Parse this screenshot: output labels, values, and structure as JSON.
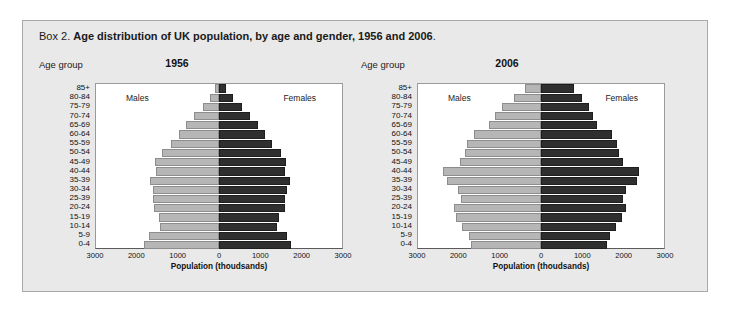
{
  "figure": {
    "box_label": "Box 2.",
    "title": "Age distribution of UK population, by age and gender, 1956 and 2006",
    "title_end": ".",
    "age_group_caption": "Age group",
    "series_labels": {
      "male": "Males",
      "female": "Females"
    },
    "colors": {
      "male_bar": "#b6b6b6",
      "female_bar": "#2f2f2f",
      "figure_background": "#e9e9e9",
      "plot_background": "#ffffff",
      "border": "#a8a8a8"
    }
  },
  "chart_data": [
    {
      "type": "bar",
      "subtype": "population-pyramid",
      "title": "1956",
      "xlabel": "Population (thoudsands)",
      "ylabel": "Age group",
      "xlim": [
        -3000,
        3000
      ],
      "xticks": [
        "3000",
        "2000",
        "1000",
        "0",
        "1000",
        "2000",
        "3000"
      ],
      "xtick_values": [
        -3000,
        -2000,
        -1000,
        0,
        1000,
        2000,
        3000
      ],
      "grid": false,
      "legend": "inside-panel",
      "categories": [
        "85+",
        "80-84",
        "75-79",
        "70-74",
        "65-69",
        "60-64",
        "55-59",
        "50-54",
        "45-49",
        "40-44",
        "35-39",
        "30-34",
        "25-39",
        "20-24",
        "15-19",
        "10-14",
        "5-9",
        "0-4"
      ],
      "series": [
        {
          "name": "Males",
          "side": "left",
          "values": [
            110,
            230,
            400,
            600,
            800,
            980,
            1180,
            1400,
            1560,
            1540,
            1680,
            1620,
            1600,
            1580,
            1460,
            1430,
            1700,
            1830
          ]
        },
        {
          "name": "Females",
          "side": "right",
          "values": [
            180,
            350,
            560,
            760,
            950,
            1120,
            1300,
            1500,
            1640,
            1600,
            1730,
            1650,
            1620,
            1600,
            1460,
            1420,
            1660,
            1760
          ]
        }
      ]
    },
    {
      "type": "bar",
      "subtype": "population-pyramid",
      "title": "2006",
      "xlabel": "Population (thoudsands)",
      "ylabel": "Age group",
      "xlim": [
        -3000,
        3000
      ],
      "xticks": [
        "3000",
        "2000",
        "1000",
        "0",
        "1000",
        "2000",
        "3000"
      ],
      "xtick_values": [
        -3000,
        -2000,
        -1000,
        0,
        1000,
        2000,
        3000
      ],
      "grid": false,
      "legend": "inside-panel",
      "categories": [
        "85+",
        "80-84",
        "75-79",
        "70-74",
        "65-69",
        "60-64",
        "55-59",
        "50-54",
        "45-49",
        "40-44",
        "35-39",
        "30-34",
        "25-39",
        "20-24",
        "15-19",
        "10-14",
        "5-9",
        "0-4"
      ],
      "series": [
        {
          "name": "Males",
          "side": "left",
          "values": [
            380,
            650,
            950,
            1130,
            1270,
            1640,
            1800,
            1860,
            1980,
            2380,
            2300,
            2020,
            1960,
            2130,
            2080,
            1930,
            1760,
            1700
          ]
        },
        {
          "name": "Females",
          "side": "right",
          "values": [
            800,
            1000,
            1180,
            1280,
            1360,
            1720,
            1850,
            1900,
            2010,
            2400,
            2330,
            2070,
            2000,
            2070,
            1980,
            1840,
            1680,
            1620
          ]
        }
      ]
    }
  ]
}
